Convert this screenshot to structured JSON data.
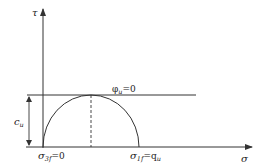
{
  "diagram": {
    "type": "mohr-circle",
    "axes": {
      "y_label": "τ",
      "x_label": "σ"
    },
    "envelope": {
      "label_symbol": "φ",
      "label_sub": "u",
      "label_rest": "=0"
    },
    "cohesion": {
      "label_symbol": "c",
      "label_sub": "u"
    },
    "minor_stress": {
      "label_symbol": "σ",
      "label_sub": "3f",
      "label_rest": "=0"
    },
    "major_stress": {
      "label_symbol": "σ",
      "label_sub": "1f",
      "label_rest": "=q",
      "label_rest_sub": "u"
    },
    "colors": {
      "line": "#333333",
      "background": "#ffffff"
    }
  }
}
